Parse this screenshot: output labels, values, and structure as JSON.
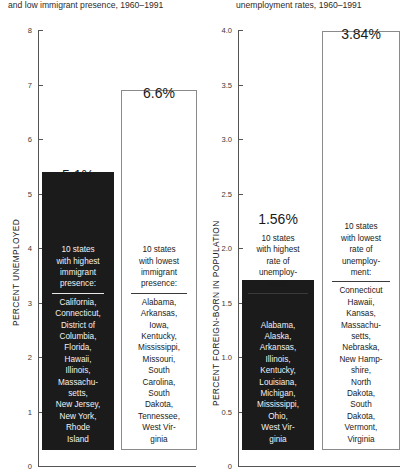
{
  "titles": {
    "left": "and low immigrant presence, 1960–1991",
    "right": "unemployment rates, 1960–1991"
  },
  "colors": {
    "dark_bar": "#1b1b1b",
    "light_bar": "#ffffff",
    "light_bar_border": "#8a8a8a",
    "axis": "#555555",
    "text": "#1a1a1a",
    "dark_bar_text": "#f2f2f2"
  },
  "chart_data": [
    {
      "type": "bar",
      "title": "and low immigrant presence, 1960–1991",
      "ylabel": "PERCENT UNEMPLOYED",
      "xlabel": "",
      "ylim": [
        0,
        8
      ],
      "yticks": [
        "0",
        "1",
        "2",
        "3",
        "4",
        "5",
        "6",
        "7",
        "8"
      ],
      "grid": false,
      "legend": "none",
      "categories": [
        "10 states with highest immigrant presence",
        "10 states with lowest immigrant presence"
      ],
      "values": [
        5.1,
        6.6
      ],
      "data_labels": [
        "5.1%",
        "6.6%"
      ],
      "bars": [
        {
          "value": 5.1,
          "label": "5.1%",
          "style": "dark",
          "header": "10 states with highest immigrant presence:",
          "header_inside": true,
          "list": "California, Connecticut, District of Columbia, Florida, Hawaii, Illinois, Massachu-setts, New Jersey, New York, Rhode Island",
          "list_lines": [
            "California,",
            "Connecticut,",
            "District of",
            "Columbia,",
            "Florida,",
            "Hawaii,",
            "Illinois,",
            "Massachu-",
            "setts,",
            "New Jersey,",
            "New York,",
            "Rhode",
            "Island"
          ],
          "header_lines": [
            "10 states",
            "with highest",
            "immigrant",
            "presence:"
          ]
        },
        {
          "value": 6.6,
          "label": "6.6%",
          "style": "light",
          "header": "10 states with lowest immigrant presence:",
          "header_inside": true,
          "list": "Alabama, Arkansas, Iowa, Kentucky, Mississippi, Missouri, South Carolina, South Dakota, Tennessee, West Virginia",
          "list_lines": [
            "Alabama,",
            "Arkansas,",
            "Iowa,",
            "Kentucky,",
            "Mississippi,",
            "Missouri,",
            "South",
            "Carolina,",
            "South",
            "Dakota,",
            "Tennessee,",
            "West Vir-",
            "ginia"
          ],
          "header_lines": [
            "10 states",
            "with lowest",
            "immigrant",
            "presence:"
          ]
        }
      ]
    },
    {
      "type": "bar",
      "title": "unemployment rates, 1960–1991",
      "ylabel": "PERCENT FOREIGN-BORN IN POPULATION",
      "xlabel": "",
      "ylim": [
        0,
        4.0
      ],
      "yticks": [
        "0",
        "0.5",
        "1.0",
        "1.5",
        "2.0",
        "2.5",
        "3.0",
        "3.5",
        "4.0"
      ],
      "grid": false,
      "legend": "none",
      "categories": [
        "10 states with highest rate of unemployment",
        "10 states with lowest rate of unemployment"
      ],
      "values": [
        1.56,
        3.84
      ],
      "data_labels": [
        "1.56%",
        "3.84%"
      ],
      "bars": [
        {
          "value": 1.56,
          "label": "1.56%",
          "style": "dark",
          "header": "10 states with highest rate of unemployment:",
          "header_inside": false,
          "list": "Alabama, Alaska, Arkansas, Illinois, Kentucky, Louisiana, Michigan, Mississippi, Ohio, West Virginia",
          "list_lines": [
            "Alabama,",
            "Alaska,",
            "Arkansas,",
            "Illinois,",
            "Kentucky,",
            "Louisiana,",
            "Michigan,",
            "Mississippi,",
            "Ohio,",
            "West Vir-",
            "ginia"
          ],
          "header_lines": [
            "10 states",
            "with highest",
            "rate of",
            "unemploy-",
            "ment:"
          ]
        },
        {
          "value": 3.84,
          "label": "3.84%",
          "style": "light",
          "header": "10 states with lowest rate of unemployment:",
          "header_inside": true,
          "list": "Connecticut Hawaii, Kansas, Massachu-setts, Nebraska, New Hamp-shire, North Dakota, South Dakota, Vermont, Virginia",
          "list_lines": [
            "Connecticut",
            "Hawaii,",
            "Kansas,",
            "Massachu-",
            "setts,",
            "Nebraska,",
            "New Hamp-",
            "shire,",
            "North",
            "Dakota,",
            "South",
            "Dakota,",
            "Vermont,",
            "Virginia"
          ],
          "header_lines": [
            "10 states",
            "with lowest",
            "rate of",
            "unemploy-",
            "ment:"
          ]
        }
      ]
    }
  ]
}
